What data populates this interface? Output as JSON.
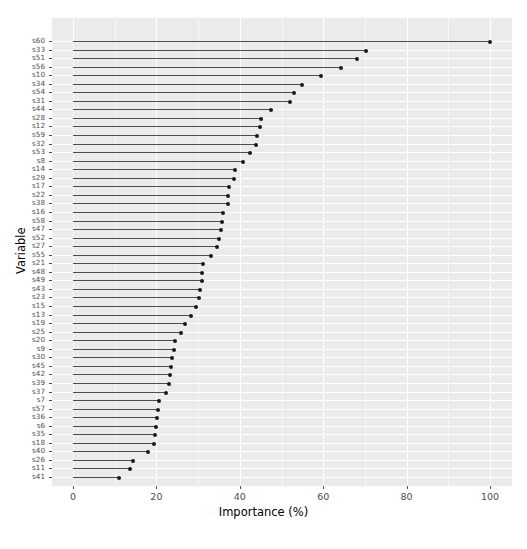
{
  "chart_data": {
    "type": "bar",
    "subtype": "lollipop-horizontal",
    "title": "",
    "xlabel": "Importance (%)",
    "ylabel": "Variable",
    "xlim": [
      0,
      105
    ],
    "xticks": [
      0,
      20,
      40,
      60,
      80,
      100
    ],
    "xtick_labels": [
      "0",
      "20",
      "40",
      "60",
      "80",
      "100"
    ],
    "grid": true,
    "grid_color": "#ffffff",
    "panel_background": "#ebebeb",
    "point_color": "#1a1a1a",
    "line_color": "#4d4d4d",
    "legend": null,
    "categories": [
      "s60",
      "s33",
      "s51",
      "s56",
      "s10",
      "s34",
      "s54",
      "s31",
      "s44",
      "s28",
      "s12",
      "s59",
      "s32",
      "s53",
      "s8",
      "s14",
      "s29",
      "s17",
      "s22",
      "s38",
      "s16",
      "s58",
      "s47",
      "s52",
      "s27",
      "s55",
      "s21",
      "s48",
      "s49",
      "s43",
      "s23",
      "s15",
      "s13",
      "s19",
      "s25",
      "s20",
      "s9",
      "s30",
      "s45",
      "s42",
      "s39",
      "s37",
      "s7",
      "s57",
      "s36",
      "s6",
      "s35",
      "s18",
      "s40",
      "s26",
      "s11",
      "s41"
    ],
    "values": [
      100,
      70.3,
      68.1,
      64.3,
      59.5,
      55.0,
      53.0,
      52.1,
      47.5,
      45.0,
      44.8,
      44.2,
      44.0,
      42.4,
      40.8,
      38.9,
      38.6,
      37.4,
      37.2,
      37.2,
      36.0,
      35.8,
      35.6,
      34.9,
      34.5,
      33.0,
      31.2,
      31.0,
      30.9,
      30.5,
      30.3,
      29.5,
      28.4,
      26.8,
      25.8,
      24.5,
      24.2,
      23.8,
      23.5,
      23.3,
      23.1,
      22.4,
      20.7,
      20.5,
      20.2,
      19.9,
      19.6,
      19.4,
      18.0,
      14.4,
      13.6,
      11.0
    ]
  }
}
